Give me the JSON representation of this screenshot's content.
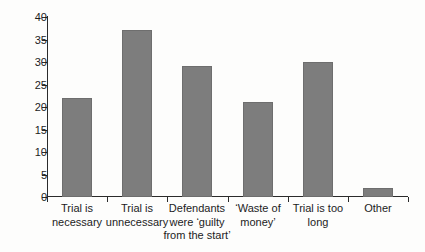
{
  "chart_data": {
    "type": "bar",
    "title": "",
    "subtitle": "",
    "xlabel": "",
    "ylabel": "",
    "ylim": [
      0,
      40
    ],
    "ytick_step": 5,
    "grid": false,
    "legend": false,
    "bar_color": "#7d7d7d",
    "axis_color": "#2b2b2b",
    "background_color": "#fdfdfc",
    "categories": [
      "Trial is\nnecessary",
      "Trial is\nunnecessary",
      "Defendants\nwere ‘guilty\nfrom the start’",
      "‘Waste of\nmoney’",
      "Trial is too\nlong",
      "Other"
    ],
    "values": [
      22,
      37,
      29,
      21,
      30,
      2
    ],
    "ytick_labels": [
      "0",
      "5",
      "10",
      "15",
      "20",
      "25",
      "30",
      "35",
      "40"
    ],
    "ytick_values": [
      0,
      5,
      10,
      15,
      20,
      25,
      30,
      35,
      40
    ]
  }
}
